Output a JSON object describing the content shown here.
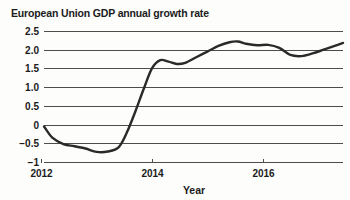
{
  "chart_data": {
    "type": "line",
    "title": "European Union GDP annual growth rate",
    "xlabel": "Year",
    "ylabel": "",
    "xlim": [
      2012.05,
      2017.45
    ],
    "ylim": [
      -1,
      2.5
    ],
    "grid": true,
    "legend": null,
    "x_ticks": [
      "2012",
      "2014",
      "2016"
    ],
    "x_tick_values": [
      2012,
      2014,
      2016
    ],
    "y_ticks": [
      "2.5",
      "2.0",
      "1.5",
      "1.0",
      "0.5",
      "0",
      "-0.5",
      "-1"
    ],
    "y_tick_values": [
      2.5,
      2.0,
      1.5,
      1.0,
      0.5,
      0,
      -0.5,
      -1
    ],
    "series": [
      {
        "name": "EU GDP annual growth rate",
        "color": "#2a2a2a",
        "x": [
          2012.05,
          2012.2,
          2012.4,
          2012.6,
          2012.8,
          2013.0,
          2013.2,
          2013.4,
          2013.55,
          2013.7,
          2013.85,
          2014.0,
          2014.15,
          2014.3,
          2014.45,
          2014.6,
          2014.8,
          2015.0,
          2015.2,
          2015.4,
          2015.55,
          2015.7,
          2015.9,
          2016.1,
          2016.3,
          2016.5,
          2016.7,
          2016.9,
          2017.1,
          2017.3,
          2017.45
        ],
        "y": [
          -0.05,
          -0.35,
          -0.52,
          -0.58,
          -0.64,
          -0.73,
          -0.72,
          -0.6,
          -0.2,
          0.35,
          0.95,
          1.5,
          1.72,
          1.68,
          1.62,
          1.65,
          1.8,
          1.95,
          2.1,
          2.2,
          2.22,
          2.16,
          2.12,
          2.13,
          2.05,
          1.86,
          1.83,
          1.9,
          2.0,
          2.1,
          2.18
        ]
      }
    ],
    "units": "percent"
  },
  "plot_geometry": {
    "left": 44,
    "right": 343,
    "top": 31,
    "bottom": 162
  }
}
